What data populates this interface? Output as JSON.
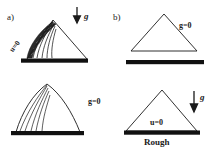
{
  "figure": {
    "width": 219,
    "height": 153,
    "background": "#ffffff",
    "ink": "#1a1a1a",
    "ground_color": "#111111"
  },
  "panels": [
    {
      "id": "a",
      "tag": "a)",
      "position": "left",
      "subpanels": [
        {
          "id": "a-top",
          "shape": "triangular-heap-with-avalanche",
          "gravity_arrow": {
            "icon": "down-arrow-icon",
            "label": "g",
            "direction": "down"
          },
          "condition_label": "u=0",
          "condition_orientation": "rotated-along-slope",
          "flow_lines": 6,
          "shaded_band": true,
          "ground": true
        },
        {
          "id": "a-bottom",
          "shape": "slumped-dome",
          "condition_label": "g=0",
          "condition_orientation": "horizontal",
          "flow_lines": 5,
          "shaded_band": false,
          "ground": true
        }
      ]
    },
    {
      "id": "b",
      "tag": "b)",
      "position": "right",
      "subpanels": [
        {
          "id": "b-top",
          "shape": "plain-triangle",
          "condition_label": "g=0",
          "condition_orientation": "horizontal",
          "flow_lines": 0,
          "shaded_band": false,
          "ground": true,
          "ground_detached": true
        },
        {
          "id": "b-bottom",
          "shape": "plain-triangle",
          "gravity_arrow": {
            "icon": "down-arrow-icon",
            "label": "g",
            "direction": "down"
          },
          "condition_label": "u=0",
          "condition_orientation": "horizontal",
          "condition_placement": "inside-base",
          "flow_lines": 0,
          "shaded_band": false,
          "ground": true,
          "caption": "Rough"
        }
      ]
    }
  ],
  "labels": {
    "panel_a_tag": "a)",
    "panel_b_tag": "b)",
    "gravity_top": "g",
    "gravity_bottom": "g",
    "u_zero_slope": "u=0",
    "g_zero_left": "g=0",
    "g_zero_right": "g=0",
    "u_zero_base": "u=0",
    "rough": "Rough"
  }
}
